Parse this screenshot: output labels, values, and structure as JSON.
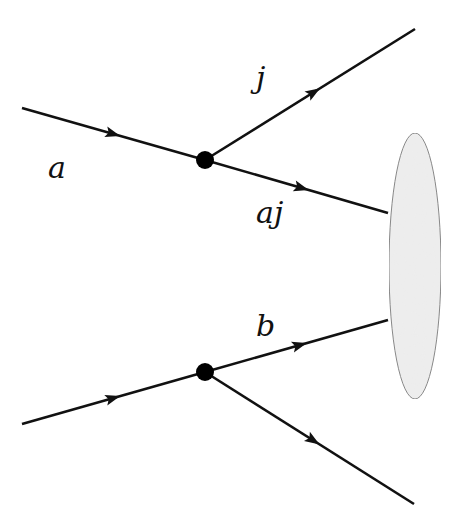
{
  "diagram": {
    "type": "feynman-diagram",
    "background": "#ffffff",
    "line_color": "#111111",
    "blob": {
      "name": "interaction-blob",
      "cx": 415,
      "cy": 266,
      "rx": 26,
      "ry": 133,
      "fill": "#eeeeee",
      "stroke": "#888888"
    },
    "vertices": [
      {
        "name": "vertex-top",
        "x": 205,
        "y": 160,
        "r": 9
      },
      {
        "name": "vertex-bottom",
        "x": 205,
        "y": 372,
        "r": 9
      }
    ],
    "lines": [
      {
        "name": "line-a-incoming",
        "x1": 22,
        "y1": 108,
        "x2": 205,
        "y2": 160,
        "arrow_at": 0.5
      },
      {
        "name": "line-j-outgoing",
        "x1": 205,
        "y1": 160,
        "x2": 415,
        "y2": 29,
        "arrow_at": 0.52
      },
      {
        "name": "line-aj-outgoing",
        "x1": 205,
        "y1": 160,
        "x2": 388,
        "y2": 213,
        "arrow_at": 0.53
      },
      {
        "name": "line-b-incoming-lower",
        "x1": 22,
        "y1": 424,
        "x2": 205,
        "y2": 372,
        "arrow_at": 0.5
      },
      {
        "name": "line-b-outgoing",
        "x1": 205,
        "y1": 372,
        "x2": 388,
        "y2": 320,
        "arrow_at": 0.52
      },
      {
        "name": "line-bottom-outgoing",
        "x1": 205,
        "y1": 372,
        "x2": 414,
        "y2": 504,
        "arrow_at": 0.52
      }
    ],
    "labels": {
      "a": {
        "text": "a",
        "x": 48,
        "y": 178
      },
      "j": {
        "text": "j",
        "x": 256,
        "y": 88
      },
      "aj": {
        "text": "aj",
        "x": 256,
        "y": 223
      },
      "b": {
        "text": "b",
        "x": 256,
        "y": 336
      }
    }
  }
}
